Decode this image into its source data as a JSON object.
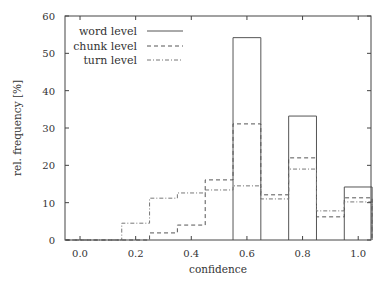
{
  "chart_data": {
    "type": "bar",
    "subtype": "step-histogram",
    "title": "",
    "xlabel": "confidence",
    "ylabel": "rel. frequency [%]",
    "xlim": [
      -0.054,
      1.046
    ],
    "ylim": [
      0,
      60
    ],
    "xticks": [
      "0.0",
      "0.2",
      "0.4",
      "0.6",
      "0.8",
      "1.0"
    ],
    "xtick_values": [
      0.0,
      0.2,
      0.4,
      0.6,
      0.8,
      1.0
    ],
    "yticks": [
      "0",
      "10",
      "20",
      "30",
      "40",
      "50",
      "60"
    ],
    "ytick_values": [
      0,
      10,
      20,
      30,
      40,
      50,
      60
    ],
    "grid": false,
    "legend_position": "upper left",
    "bin_width": 0.1,
    "x": [
      0.0,
      0.1,
      0.2,
      0.3,
      0.4,
      0.5,
      0.6,
      0.7,
      0.8,
      0.9,
      1.0
    ],
    "series": [
      {
        "name": "word level",
        "style": "solid",
        "values": [
          0,
          0,
          0,
          0,
          0,
          0,
          54.2,
          0,
          33.2,
          0,
          14.2
        ]
      },
      {
        "name": "chunk level",
        "style": "dashed",
        "values": [
          0,
          0,
          0,
          1.9,
          4.0,
          16.1,
          31.1,
          12.1,
          22.0,
          6.2,
          11.3
        ]
      },
      {
        "name": "turn level",
        "style": "dashdot",
        "values": [
          0,
          0,
          4.5,
          11.2,
          12.6,
          13.4,
          14.5,
          11.0,
          19.0,
          7.8,
          10.2
        ]
      }
    ]
  },
  "legend": {
    "items": [
      {
        "label": "word level"
      },
      {
        "label": "chunk level"
      },
      {
        "label": "turn level"
      }
    ]
  },
  "axes": {
    "xlabel": "confidence",
    "ylabel": "rel. frequency [%]"
  },
  "colors": {
    "line": "#555555",
    "axis": "#444444",
    "background": "#ffffff"
  }
}
